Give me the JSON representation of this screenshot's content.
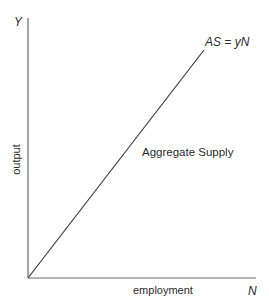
{
  "diagram": {
    "type": "economics-graph",
    "axes": {
      "y_axis_symbol": "Y",
      "y_axis_label": "output",
      "x_axis_symbol": "N",
      "x_axis_label": "employment"
    },
    "curves": [
      {
        "name": "Aggregate Supply",
        "equation": "AS = yN",
        "shape": "straight line through origin, upward sloping"
      }
    ],
    "colors": {
      "line": "#3a3a3a",
      "axis": "#6a6a6a",
      "text": "#2a2a2a",
      "background": "#ffffff"
    }
  }
}
